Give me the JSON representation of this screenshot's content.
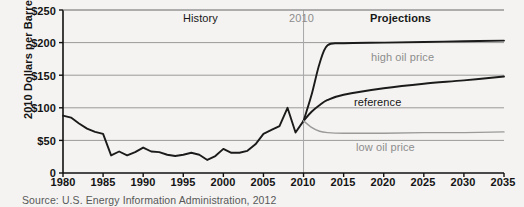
{
  "figure": {
    "source_note": "Source: U.S. Energy Information Administration, 2012"
  },
  "annotations": {
    "history": "History",
    "projections": "Projections",
    "divider_year": "2010",
    "high": "high oil price",
    "reference": "reference",
    "low": "low oil price"
  },
  "colors": {
    "background": "#f4f3f1",
    "axis": "#111111",
    "gridline": "#8f8f8f",
    "series_dark": "#1b1b1b",
    "series_gray": "#9a9a9a",
    "divider": "#a8a8a8",
    "text_dark": "#141414",
    "text_gray": "#8d8d8d"
  },
  "chart_data": {
    "type": "line",
    "title": "",
    "xlabel": "",
    "ylabel": "2010 Dollars per Barrel",
    "xlim": [
      1980,
      2035
    ],
    "ylim": [
      0,
      250
    ],
    "grid": true,
    "legend": "inline-labels",
    "ytick_labels": [
      "0",
      "$50",
      "$100",
      "$150",
      "$200",
      "$250"
    ],
    "ytick_values": [
      0,
      50,
      100,
      150,
      200,
      250
    ],
    "xtick_labels": [
      "1980",
      "1985",
      "1990",
      "1995",
      "2000",
      "2005",
      "2010",
      "2015",
      "2020",
      "2025",
      "2030",
      "2035"
    ],
    "xtick_values": [
      1980,
      1985,
      1990,
      1995,
      2000,
      2005,
      2010,
      2015,
      2020,
      2025,
      2030,
      2035
    ],
    "divider_x": 2010,
    "series": [
      {
        "name": "History",
        "color": "#1b1b1b",
        "x": [
          1980,
          1981,
          1982,
          1983,
          1984,
          1985,
          1986,
          1987,
          1988,
          1989,
          1990,
          1991,
          1992,
          1993,
          1994,
          1995,
          1996,
          1997,
          1998,
          1999,
          2000,
          2001,
          2002,
          2003,
          2004,
          2005,
          2006,
          2007,
          2008,
          2009,
          2010
        ],
        "values": [
          88,
          85,
          76,
          68,
          63,
          60,
          27,
          33,
          27,
          32,
          39,
          33,
          32,
          28,
          26,
          28,
          31,
          28,
          20,
          26,
          37,
          31,
          31,
          34,
          44,
          60,
          66,
          72,
          100,
          62,
          80
        ]
      },
      {
        "name": "high oil price",
        "color": "#1b1b1b",
        "x": [
          2010,
          2011,
          2012,
          2013,
          2015,
          2020,
          2025,
          2030,
          2035
        ],
        "values": [
          80,
          120,
          168,
          196,
          199,
          200,
          201,
          202,
          203
        ]
      },
      {
        "name": "reference",
        "color": "#1b1b1b",
        "x": [
          2010,
          2011,
          2012,
          2013,
          2015,
          2020,
          2025,
          2030,
          2035
        ],
        "values": [
          80,
          94,
          104,
          112,
          120,
          130,
          137,
          142,
          148
        ]
      },
      {
        "name": "low oil price",
        "color": "#9a9a9a",
        "x": [
          2010,
          2011,
          2012,
          2013,
          2015,
          2020,
          2025,
          2030,
          2035
        ],
        "values": [
          80,
          70,
          64,
          62,
          61,
          61,
          62,
          62,
          63
        ]
      }
    ]
  }
}
